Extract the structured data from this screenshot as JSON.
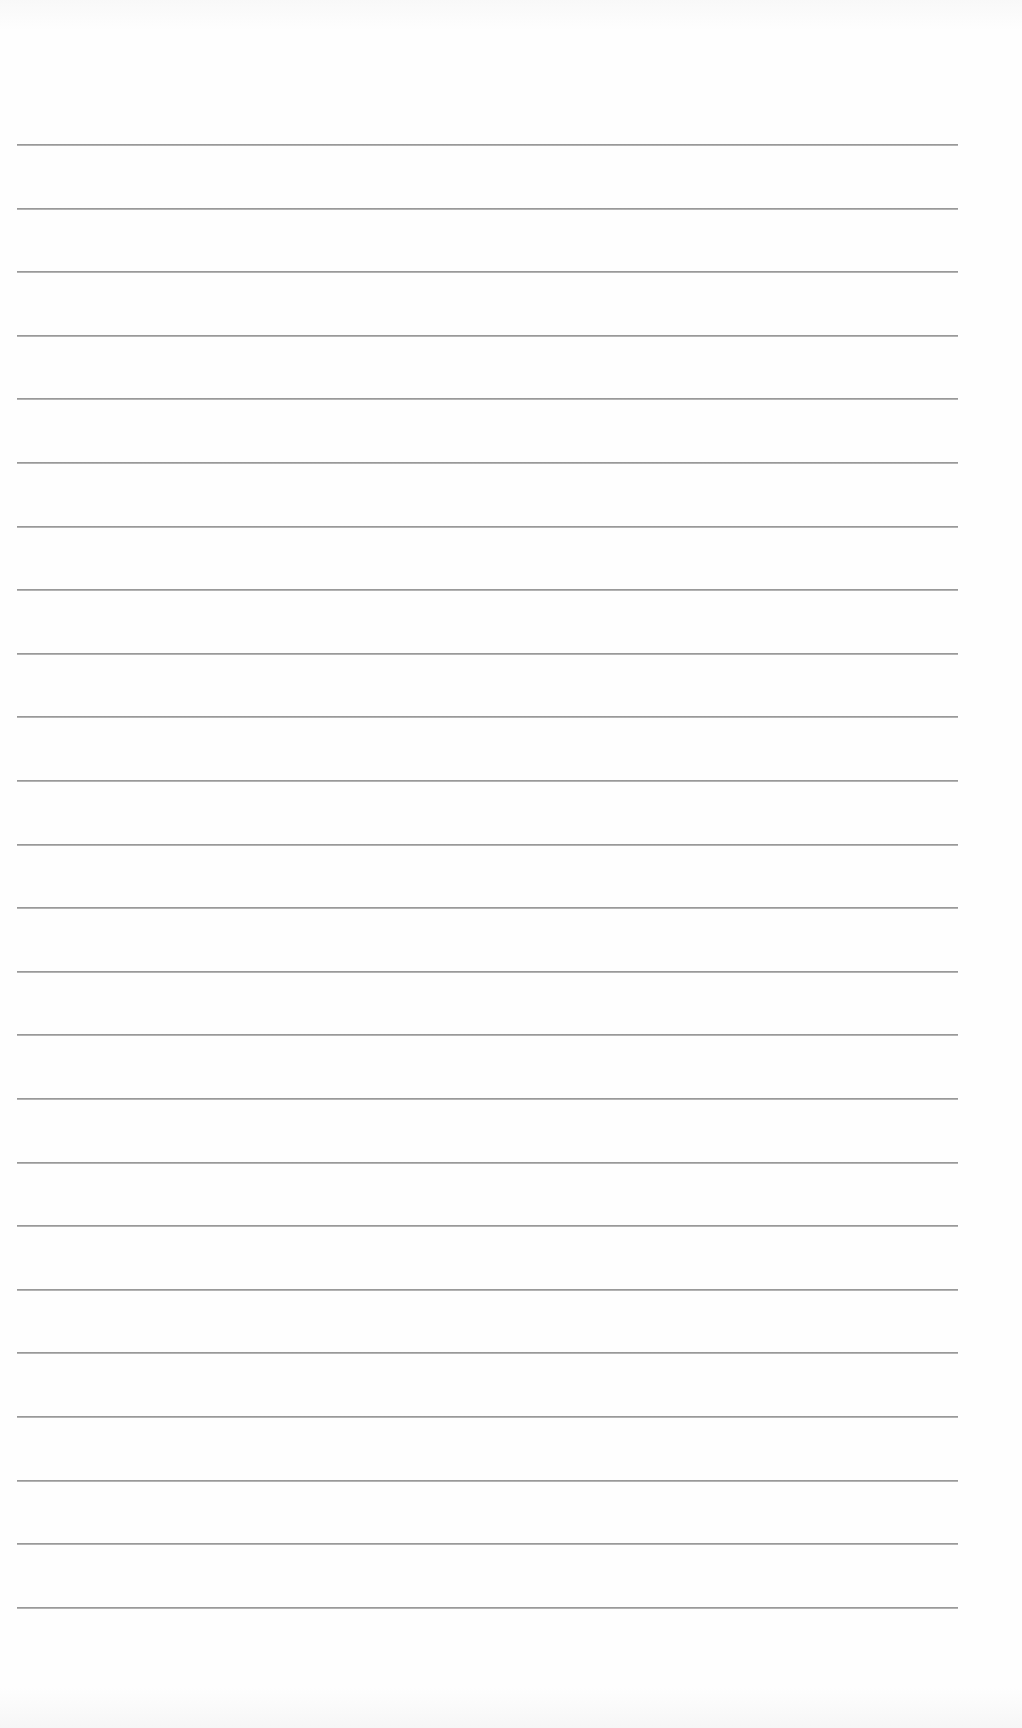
{
  "document": {
    "type": "blank ruled sheet",
    "background_color": "#fefefe",
    "rule_color": "#808080",
    "rule_count": 24,
    "rule_start_y": 144,
    "rule_spacing": 63.6,
    "rule_left_x": 17,
    "rule_right_x": 958
  }
}
